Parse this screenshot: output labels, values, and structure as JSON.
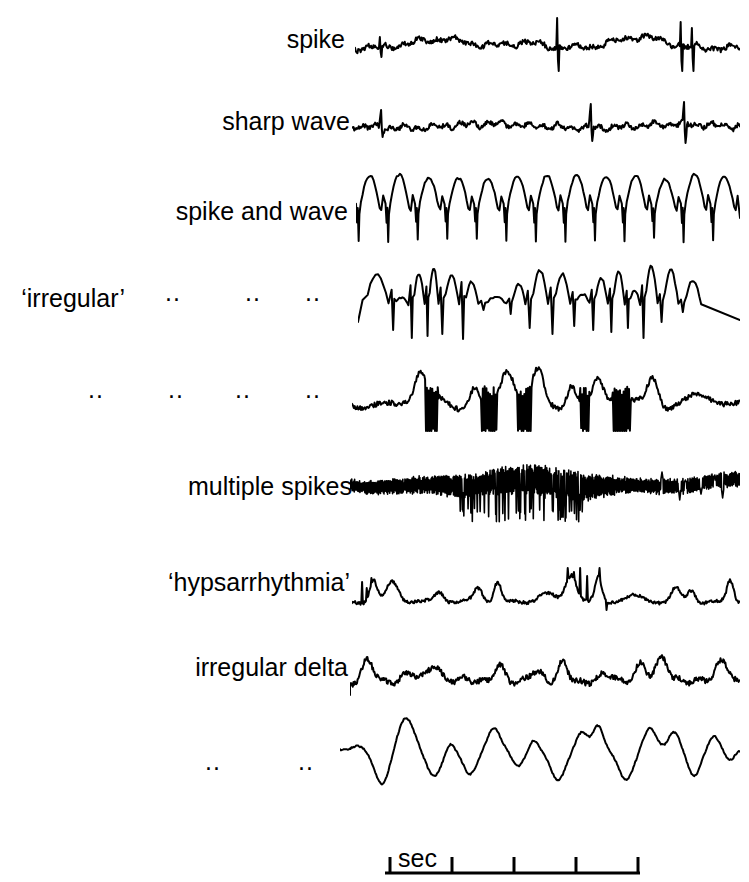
{
  "figure": {
    "width": 749,
    "height": 882,
    "background": "#ffffff",
    "ink_color": "#000000",
    "caption": ""
  },
  "ditto_mark": "..",
  "scale": {
    "label": "sec",
    "x_start": 385,
    "x_end": 640,
    "y_baseline": 873,
    "ticks": [
      390,
      452,
      514,
      576,
      638
    ],
    "tick_height": 16,
    "label_x": 398,
    "label_y": 846
  },
  "rows": [
    {
      "label": "spike",
      "label_x_right": 345,
      "label_y": 40,
      "dittos": [],
      "trace": {
        "x": 355,
        "y": 8,
        "width": 385,
        "height": 64,
        "baseline": 40,
        "stroke_width": 2.0,
        "kind": "spike"
      }
    },
    {
      "label": "sharp wave",
      "label_x_right": 350,
      "label_y": 122,
      "dittos": [],
      "trace": {
        "x": 352,
        "y": 96,
        "width": 388,
        "height": 56,
        "baseline": 30,
        "stroke_width": 2.0,
        "kind": "sharp-wave"
      }
    },
    {
      "label": "spike and wave",
      "label_x_right": 348,
      "label_y": 212,
      "dittos": [],
      "trace": {
        "x": 356,
        "y": 164,
        "width": 384,
        "height": 86,
        "baseline": 46,
        "stroke_width": 2.0,
        "kind": "spike-and-wave"
      }
    },
    {
      "label": "‘irregular’",
      "label_x_right": 125,
      "label_y": 299,
      "dittos": [
        165,
        245,
        305
      ],
      "trace": {
        "x": 358,
        "y": 248,
        "width": 382,
        "height": 92,
        "baseline": 56,
        "stroke_width": 2.0,
        "kind": "irregular-spike-wave"
      }
    },
    {
      "label": "",
      "label_x_right": 125,
      "label_y": 396,
      "dittos": [
        88,
        168,
        235,
        305
      ],
      "trace": {
        "x": 352,
        "y": 346,
        "width": 388,
        "height": 86,
        "baseline": 56,
        "stroke_width": 2.0,
        "kind": "irregular-mixed"
      }
    },
    {
      "label": "multiple spikes",
      "label_x_right": 352,
      "label_y": 487,
      "dittos": [],
      "trace": {
        "x": 350,
        "y": 448,
        "width": 390,
        "height": 76,
        "baseline": 36,
        "stroke_width": 1.6,
        "kind": "multiple-spikes"
      }
    },
    {
      "label": "‘hypsarrhythmia’",
      "label_x_right": 350,
      "label_y": 583,
      "dittos": [],
      "trace": {
        "x": 352,
        "y": 542,
        "width": 388,
        "height": 72,
        "baseline": 50,
        "stroke_width": 2.0,
        "kind": "hypsarrhythmia"
      }
    },
    {
      "label": "irregular delta",
      "label_x_right": 348,
      "label_y": 668,
      "dittos": [],
      "trace": {
        "x": 350,
        "y": 626,
        "width": 390,
        "height": 70,
        "baseline": 48,
        "stroke_width": 2.0,
        "kind": "irregular-delta"
      }
    },
    {
      "label": "",
      "label_x_right": 330,
      "label_y": 768,
      "dittos": [
        205,
        298
      ],
      "trace": {
        "x": 340,
        "y": 704,
        "width": 400,
        "height": 96,
        "baseline": 46,
        "stroke_width": 2.0,
        "kind": "slow-delta"
      }
    }
  ],
  "chart_data": {
    "type": "line",
    "title": "",
    "xlabel": "sec",
    "ylabel": "",
    "grid": false,
    "legend": "none",
    "note": "Nine EEG epileptiform waveform traces, each labelled at left; common time scale bar at bottom marked 'sec' with four one-second intervals.",
    "series": [
      {
        "name": "spike",
        "description": "low-amplitude irregular background with isolated high sharp spikes"
      },
      {
        "name": "sharp wave",
        "description": "low-amplitude fast background with three tall sharp transients"
      },
      {
        "name": "spike and wave",
        "description": "regular repetitive spike followed by slow dome, about 13 cycles"
      },
      {
        "name": "'irregular'",
        "description": "irregular spike-and-wave, variable amplitude and interval"
      },
      {
        "name": "'irregular' (2)",
        "description": "irregular mixed spikes and slow waves"
      },
      {
        "name": "multiple spikes",
        "description": "dense rapid polyspike burst with crescendo then decrescendo"
      },
      {
        "name": "'hypsarrhythmia'",
        "description": "high-amplitude chaotic slow waves with multifocal spikes"
      },
      {
        "name": "irregular delta",
        "description": "slow delta waves with superimposed faster activity"
      },
      {
        "name": "irregular delta (2)",
        "description": "smooth high-amplitude slow delta waves"
      }
    ]
  }
}
